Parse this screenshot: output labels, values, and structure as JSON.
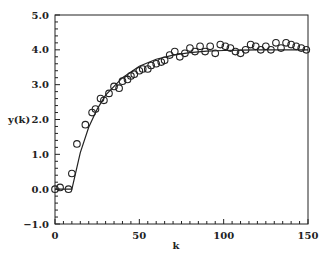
{
  "chart_data": {
    "type": "scatter",
    "title": "",
    "xlabel": "k",
    "ylabel": "y(k)",
    "xlim": [
      0,
      150
    ],
    "ylim": [
      -1.0,
      5.0
    ],
    "xticks": [
      0,
      50,
      100,
      150
    ],
    "xtick_labels": [
      "0",
      "50",
      "100",
      "150"
    ],
    "yticks": [
      -1.0,
      0.0,
      1.0,
      2.0,
      3.0,
      4.0,
      5.0
    ],
    "ytick_labels": [
      "−1.0",
      "0.0",
      "1.0",
      "2.0",
      "3.0",
      "4.0",
      "5.0"
    ],
    "grid": false,
    "legend": null,
    "series": [
      {
        "name": "measured y(k)",
        "style": "open-circle markers",
        "x": [
          0,
          3,
          8,
          10,
          13,
          18,
          22,
          24,
          27,
          29,
          32,
          35,
          38,
          40,
          43,
          45,
          47,
          50,
          52,
          55,
          57,
          60,
          63,
          65,
          68,
          71,
          74,
          77,
          80,
          83,
          86,
          89,
          92,
          95,
          98,
          101,
          104,
          107,
          110,
          113,
          116,
          119,
          122,
          125,
          128,
          131,
          134,
          137,
          140,
          143,
          146,
          149
        ],
        "y": [
          0.0,
          0.05,
          0.0,
          0.45,
          1.3,
          1.85,
          2.2,
          2.3,
          2.6,
          2.55,
          2.75,
          2.95,
          2.9,
          3.1,
          3.15,
          3.25,
          3.3,
          3.4,
          3.45,
          3.45,
          3.55,
          3.6,
          3.65,
          3.7,
          3.85,
          3.95,
          3.8,
          3.9,
          4.05,
          3.95,
          4.1,
          3.95,
          4.1,
          3.9,
          4.15,
          4.1,
          4.05,
          3.95,
          3.9,
          4.0,
          4.15,
          4.1,
          4.0,
          4.1,
          4.0,
          4.2,
          4.05,
          4.2,
          4.15,
          4.1,
          4.05,
          4.0
        ]
      },
      {
        "name": "model response",
        "style": "solid line",
        "x": [
          0,
          10,
          15,
          20,
          25,
          30,
          40,
          50,
          60,
          70,
          80,
          90,
          100,
          110,
          120,
          130,
          140,
          150
        ],
        "y": [
          0.0,
          0.0,
          1.05,
          1.78,
          2.3,
          2.7,
          3.2,
          3.53,
          3.73,
          3.85,
          3.92,
          3.96,
          3.98,
          3.99,
          4.0,
          4.0,
          4.0,
          4.0
        ]
      }
    ]
  }
}
